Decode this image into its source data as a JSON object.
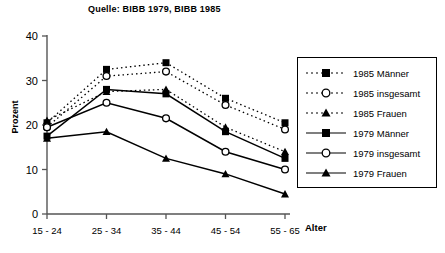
{
  "title": "Quelle: BIBB 1979, BIBB 1985",
  "axis": {
    "ylabel": "Prozent",
    "xlabel": "Alter",
    "yticks": [
      "0",
      "10",
      "20",
      "30",
      "40"
    ],
    "xticks": [
      "15 - 24",
      "25 - 34",
      "35 - 44",
      "45 - 54",
      "55 - 65"
    ]
  },
  "legend": {
    "items": [
      {
        "label": "1985 Männer",
        "marker": "square-marker",
        "line": "dotted"
      },
      {
        "label": "1985 insgesamt",
        "marker": "circle-marker",
        "line": "dotted"
      },
      {
        "label": "1985 Frauen",
        "marker": "triangle-marker",
        "line": "dotted"
      },
      {
        "label": "1979 Männer",
        "marker": "square-marker",
        "line": "solid"
      },
      {
        "label": "1979 insgesamt",
        "marker": "circle-marker",
        "line": "solid"
      },
      {
        "label": "1979 Frauen",
        "marker": "triangle-marker",
        "line": "solid"
      }
    ]
  },
  "chart_data": {
    "type": "line",
    "title": "Quelle: BIBB 1979, BIBB 1985",
    "xlabel": "Alter",
    "ylabel": "Prozent",
    "categories": [
      "15 - 24",
      "25 - 34",
      "35 - 44",
      "45 - 54",
      "55 - 65"
    ],
    "ylim": [
      0,
      40
    ],
    "ytick_step": 10,
    "grid": false,
    "legend_position": "right",
    "series": [
      {
        "name": "1985 Männer",
        "marker": "square",
        "line": "dotted",
        "values": [
          20.5,
          32.5,
          34.0,
          26.0,
          20.5
        ]
      },
      {
        "name": "1985 insgesamt",
        "marker": "circle",
        "line": "dotted",
        "values": [
          19.5,
          31.0,
          32.0,
          24.5,
          19.0
        ]
      },
      {
        "name": "1985 Frauen",
        "marker": "triangle",
        "line": "dotted",
        "values": [
          21.0,
          27.5,
          28.0,
          19.5,
          14.0
        ]
      },
      {
        "name": "1979 Männer",
        "marker": "square",
        "line": "solid",
        "values": [
          17.5,
          28.0,
          27.0,
          18.5,
          12.5
        ]
      },
      {
        "name": "1979 insgesamt",
        "marker": "circle",
        "line": "solid",
        "values": [
          19.5,
          25.0,
          21.5,
          14.0,
          10.0
        ]
      },
      {
        "name": "1979 Frauen",
        "marker": "triangle",
        "line": "solid",
        "values": [
          17.0,
          18.5,
          12.5,
          9.0,
          4.5
        ]
      }
    ]
  }
}
